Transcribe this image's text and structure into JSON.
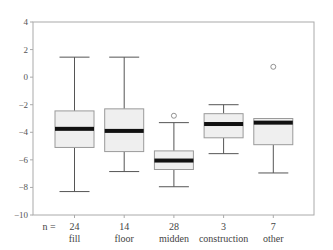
{
  "chart_data": {
    "type": "boxplot",
    "title": "",
    "xlabel": "",
    "ylabel": "",
    "ylim": [
      -10,
      4
    ],
    "yticks": [
      4,
      2,
      0,
      -2,
      -4,
      -6,
      -8,
      -10
    ],
    "grid": false,
    "n_prefix": "n =",
    "categories": [
      "fill",
      "floor",
      "midden",
      "construction",
      "other"
    ],
    "n": [
      24,
      14,
      28,
      3,
      7
    ],
    "boxes": [
      {
        "category": "fill",
        "n": 24,
        "whisker_low": -8.3,
        "q1": -5.1,
        "median": -3.75,
        "q3": -2.45,
        "whisker_high": 1.45,
        "outliers": []
      },
      {
        "category": "floor",
        "n": 14,
        "whisker_low": -6.85,
        "q1": -5.4,
        "median": -3.9,
        "q3": -2.3,
        "whisker_high": 1.45,
        "outliers": []
      },
      {
        "category": "midden",
        "n": 28,
        "whisker_low": -7.95,
        "q1": -6.7,
        "median": -6.05,
        "q3": -5.35,
        "whisker_high": -3.3,
        "outliers": [
          -2.8
        ]
      },
      {
        "category": "construction",
        "n": 3,
        "whisker_low": -5.55,
        "q1": -4.4,
        "median": -3.4,
        "q3": -2.65,
        "whisker_high": -2.0,
        "outliers": []
      },
      {
        "category": "other",
        "n": 7,
        "whisker_low": -6.95,
        "q1": -4.9,
        "median": -3.3,
        "q3": -3.0,
        "whisker_high": -3.0,
        "outliers": [
          0.75
        ]
      }
    ],
    "colors": {
      "box_fill": "#efefef",
      "box_stroke": "#9a9a9a",
      "median": "#111111",
      "whisker": "#555555",
      "frame": "#aaaaaa"
    }
  }
}
